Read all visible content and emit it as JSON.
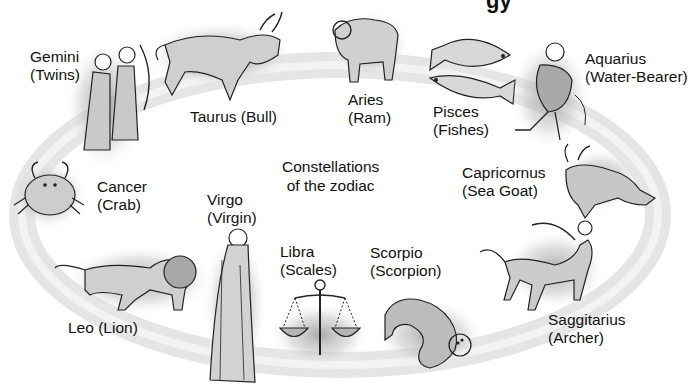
{
  "title_fragment": "gy",
  "center_label": {
    "line1": "Constellations",
    "line2": "of the zodiac"
  },
  "constellations": [
    {
      "name": "Gemini",
      "meaning": "(Twins)",
      "icon": "twins-icon"
    },
    {
      "name": "Taurus",
      "meaning": "(Bull)",
      "icon": "bull-icon"
    },
    {
      "name": "Aries",
      "meaning": "(Ram)",
      "icon": "ram-icon"
    },
    {
      "name": "Pisces",
      "meaning": "(Fishes)",
      "icon": "fishes-icon"
    },
    {
      "name": "Aquarius",
      "meaning": "(Water-Bearer)",
      "icon": "water-bearer-icon"
    },
    {
      "name": "Capricornus",
      "meaning": "(Sea Goat)",
      "icon": "sea-goat-icon"
    },
    {
      "name": "Saggitarius",
      "meaning": "(Archer)",
      "icon": "archer-icon"
    },
    {
      "name": "Scorpio",
      "meaning": "(Scorpion)",
      "icon": "scorpion-icon"
    },
    {
      "name": "Libra",
      "meaning": "(Scales)",
      "icon": "scales-icon"
    },
    {
      "name": "Virgo",
      "meaning": "(Virgin)",
      "icon": "virgin-icon"
    },
    {
      "name": "Leo",
      "meaning": "(Lion)",
      "icon": "lion-icon"
    },
    {
      "name": "Cancer",
      "meaning": "(Crab)",
      "icon": "crab-icon"
    }
  ],
  "colors": {
    "background": "#ffffff",
    "ring": "#d9d9d9",
    "figure_fill": "#bdbdbd",
    "line": "#222222"
  }
}
